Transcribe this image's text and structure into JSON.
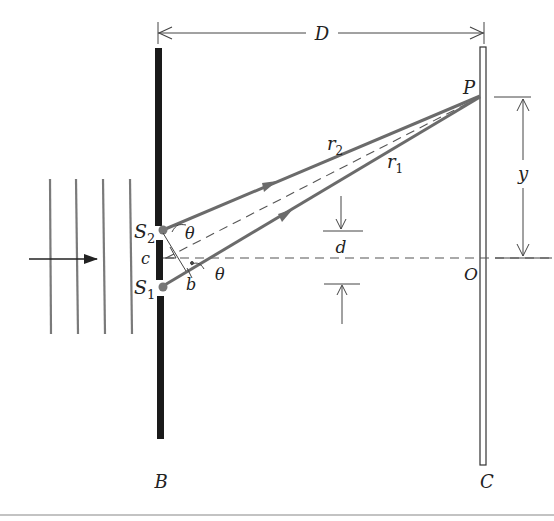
{
  "figure": {
    "labels": {
      "distance": "D",
      "point": "P",
      "origin": "O",
      "height": "y",
      "slit_sep": "d",
      "barrier": "B",
      "screen": "C",
      "slit2": "S",
      "slit2_sub": "2",
      "slit1": "S",
      "slit1_sub": "1",
      "path2": "r",
      "path2_sub": "2",
      "path1": "r",
      "path1_sub": "1",
      "angle_top": "θ",
      "angle_mid": "θ",
      "corner": "c",
      "path_diff": "b"
    },
    "colors": {
      "rays": "#6b6b6b",
      "barrier": "#1a1a1a",
      "lines": "#333333",
      "wavefronts": "#7a7a7a",
      "dots": "#777777"
    },
    "wavefront_count": 4
  }
}
